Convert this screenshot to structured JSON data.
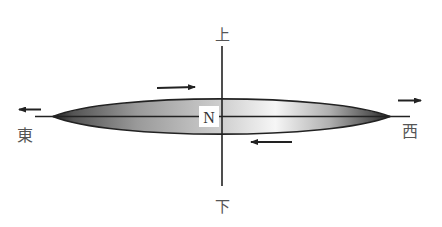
{
  "diagram": {
    "labels": {
      "top": "上",
      "bottom": "下",
      "left": "東",
      "right": "西",
      "center": "N"
    },
    "colors": {
      "stroke": "#222222",
      "label": "#555555",
      "gradient_dark": "#2a2a2a",
      "gradient_mid": "#b8b8b8",
      "gradient_light": "#f4f4f4"
    },
    "arrows": [
      {
        "id": "top-arrow",
        "direction": "right"
      },
      {
        "id": "bottom-arrow",
        "direction": "left"
      },
      {
        "id": "left-arrow",
        "direction": "left"
      },
      {
        "id": "right-arrow",
        "direction": "right"
      }
    ]
  }
}
